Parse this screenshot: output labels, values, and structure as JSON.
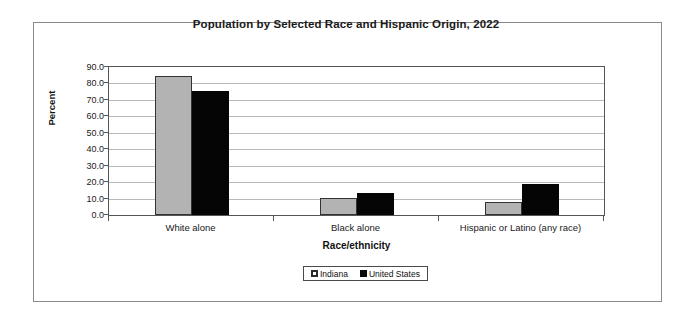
{
  "chart_data": {
    "type": "bar",
    "title": "Population by Selected Race and Hispanic Origin, 2022",
    "xlabel": "Race/ethnicity",
    "ylabel": "Percent",
    "categories": [
      "White alone",
      "Black alone",
      "Hispanic or Latino (any race)"
    ],
    "series": [
      {
        "name": "Indiana",
        "values": [
          84.5,
          10.2,
          8.2
        ],
        "color": "#b3b3b3"
      },
      {
        "name": "United States",
        "values": [
          75.5,
          13.6,
          19.1
        ],
        "color": "#050505"
      }
    ],
    "ylim": [
      0,
      90
    ],
    "ytick_labels": [
      "90.0",
      "80.0",
      "70.0",
      "60.0",
      "50.0",
      "40.0",
      "30.0",
      "20.0",
      "10.0",
      "0.0"
    ],
    "ytick_values": [
      90,
      80,
      70,
      60,
      50,
      40,
      30,
      20,
      10,
      0
    ],
    "grid": true,
    "legend_position": "bottom"
  },
  "legend": {
    "entries": [
      {
        "label": "Indiana",
        "swatch": "indiana-swatch-icon"
      },
      {
        "label": "United States",
        "swatch": "united-states-swatch-icon"
      }
    ]
  }
}
